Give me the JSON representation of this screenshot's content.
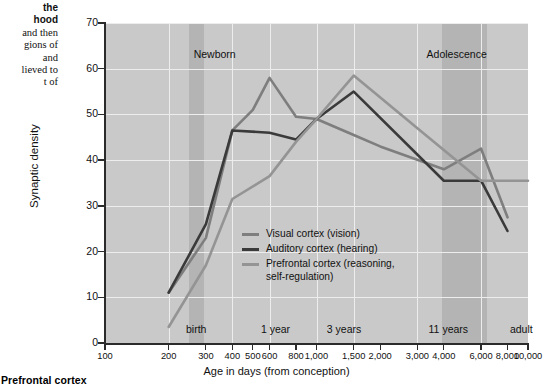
{
  "margin_text": {
    "line1": "the",
    "line2": "hood",
    "line3": "and then",
    "line4": "gions of",
    "line5": "and",
    "line6": "lieved to",
    "line7": "t of"
  },
  "bottom_caption": "Prefrontal cortex",
  "chart_data": {
    "type": "line",
    "title": "",
    "xlabel": "Age in days (from conception)",
    "ylabel": "Synaptic density",
    "xscale": "log",
    "xlim": [
      100,
      10000
    ],
    "ylim": [
      0,
      70
    ],
    "yticks": [
      0,
      10,
      20,
      30,
      40,
      50,
      60,
      70
    ],
    "xticks": [
      100,
      200,
      300,
      400,
      500,
      600,
      800,
      1000,
      1500,
      2000,
      3000,
      4000,
      6000,
      8000,
      10000
    ],
    "xtick_labels": [
      "100",
      "200",
      "300",
      "400",
      "500",
      "600",
      "800",
      "1,000",
      "1,500",
      "2,000",
      "3,000",
      "4,000",
      "6,000",
      "8,000",
      "10,000"
    ],
    "grid": true,
    "legend_position": "inside-lower-left",
    "era_annotations": [
      {
        "label": "Newborn",
        "x": 330
      },
      {
        "label": "Adolescence",
        "x": 4600
      }
    ],
    "stage_annotations": [
      {
        "label": "birth",
        "x": 270
      },
      {
        "label": "1 year",
        "x": 640
      },
      {
        "label": "3 years",
        "x": 1350
      },
      {
        "label": "11 years",
        "x": 4200
      },
      {
        "label": "adult",
        "x": 9300
      }
    ],
    "shaded_bands": [
      {
        "from": 250,
        "to": 295
      },
      {
        "from": 3900,
        "to": 6400
      }
    ],
    "series": [
      {
        "name": "Visual cortex (vision)",
        "color": "#7e7e7e",
        "points": [
          [
            200,
            11
          ],
          [
            300,
            23
          ],
          [
            400,
            46.5
          ],
          [
            500,
            51
          ],
          [
            600,
            58
          ],
          [
            800,
            49.5
          ],
          [
            1000,
            49
          ],
          [
            1500,
            45.5
          ],
          [
            2000,
            43
          ],
          [
            4000,
            38
          ],
          [
            6000,
            42.5
          ],
          [
            8000,
            27.5
          ]
        ]
      },
      {
        "name": "Auditory cortex (hearing)",
        "color": "#3a3a3a",
        "points": [
          [
            200,
            11
          ],
          [
            300,
            26
          ],
          [
            400,
            46.5
          ],
          [
            600,
            46
          ],
          [
            800,
            44.5
          ],
          [
            1000,
            49
          ],
          [
            1500,
            55
          ],
          [
            4000,
            35.5
          ],
          [
            6000,
            35.5
          ],
          [
            8000,
            24.5
          ]
        ]
      },
      {
        "name": "Prefrontal cortex (reasoning,\nself-regulation)",
        "color": "#949494",
        "points": [
          [
            200,
            3.5
          ],
          [
            300,
            17
          ],
          [
            400,
            31.5
          ],
          [
            600,
            36.5
          ],
          [
            800,
            44
          ],
          [
            1000,
            49
          ],
          [
            1500,
            58.5
          ],
          [
            3000,
            47
          ],
          [
            6000,
            35.5
          ],
          [
            10000,
            35.5
          ]
        ]
      }
    ]
  },
  "legend": {
    "items": [
      {
        "label": "Visual cortex (vision)",
        "color": "#7e7e7e"
      },
      {
        "label": "Auditory cortex (hearing)",
        "color": "#3a3a3a"
      },
      {
        "label": "Prefrontal cortex (reasoning,\nself-regulation)",
        "color": "#949494"
      }
    ]
  }
}
